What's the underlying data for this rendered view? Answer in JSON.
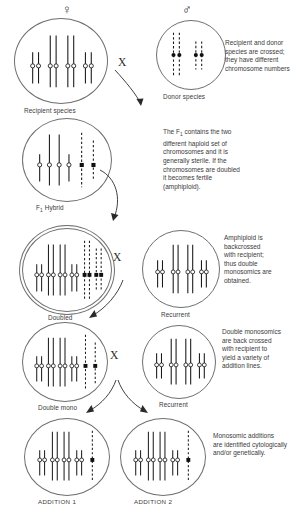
{
  "diagram": {
    "type": "genetics-breeding-scheme",
    "symbols": {
      "female": "♀",
      "male": "♂",
      "cross": "X"
    },
    "colors": {
      "outline": "#6f6f6f",
      "chromosome": "#1a1a1a",
      "text": "#3a3a3a",
      "background": "#ffffff"
    },
    "legend": {
      "solid_chromosome": "recipient species chromosome (solid line, open centromere)",
      "dashed_chromosome": "donor species chromosome (dashed line, filled centromere)"
    }
  },
  "cells": [
    {
      "id": "recipient-species",
      "label": "Recipient species",
      "symbol": "♀",
      "double_ring": false,
      "solid_chromosomes": 8,
      "dashed_chromosomes": 0,
      "centromere": "open",
      "pairs": [
        {
          "type": "solid",
          "count": 2,
          "length": "short"
        },
        {
          "type": "solid",
          "count": 2,
          "length": "long"
        },
        {
          "type": "solid",
          "count": 2,
          "length": "long"
        },
        {
          "type": "solid",
          "count": 2,
          "length": "short"
        }
      ]
    },
    {
      "id": "donor-species",
      "label": "Donor species",
      "symbol": "♂",
      "double_ring": false,
      "solid_chromosomes": 0,
      "dashed_chromosomes": 4,
      "centromere": "filled",
      "pairs": [
        {
          "type": "dashed",
          "count": 2,
          "length": "long"
        },
        {
          "type": "dashed",
          "count": 2,
          "length": "short"
        }
      ]
    },
    {
      "id": "f1-hybrid",
      "label": "F1 Hybrid",
      "label_base": "F",
      "label_sub": "1",
      "label_rest": " Hybrid",
      "double_ring": false,
      "solid_chromosomes": 4,
      "dashed_chromosomes": 2,
      "centromere": "mixed"
    },
    {
      "id": "doubled",
      "label": "Doubled",
      "double_ring": true,
      "solid_chromosomes": 8,
      "dashed_chromosomes": 4,
      "centromere": "mixed"
    },
    {
      "id": "recurrent-1",
      "label": "Recurrent",
      "double_ring": false,
      "solid_chromosomes": 8,
      "dashed_chromosomes": 0,
      "centromere": "open"
    },
    {
      "id": "double-mono",
      "label": "Double mono",
      "double_ring": false,
      "solid_chromosomes": 8,
      "dashed_chromosomes": 2,
      "centromere": "mixed"
    },
    {
      "id": "recurrent-2",
      "label": "Recurrent",
      "double_ring": false,
      "solid_chromosomes": 8,
      "dashed_chromosomes": 0,
      "centromere": "open"
    },
    {
      "id": "addition-1",
      "label": "ADDITION 1",
      "double_ring": false,
      "solid_chromosomes": 8,
      "dashed_chromosomes": 1,
      "centromere": "mixed"
    },
    {
      "id": "addition-2",
      "label": "ADDITION 2",
      "double_ring": false,
      "solid_chromosomes": 8,
      "dashed_chromosomes": 1,
      "centromere": "mixed"
    }
  ],
  "notes": [
    {
      "id": "note-1",
      "text": "Recipient and donor species are crossed; they have different chromosome numbers"
    },
    {
      "id": "note-2",
      "text": "The F1 contains the two different haploid set of chromosomes and it is generally sterile.  If the chromosomes are doubled it becomes fertile (amphiploid).",
      "line1_pre": "The F",
      "line1_sub": "1",
      "line1_post": " contains the two",
      "lines_rest": [
        "different haploid set of",
        "chromosomes and it is",
        "generally sterile.  If the",
        "chromosomes are doubled",
        "it becomes fertile",
        "(amphiploid)."
      ]
    },
    {
      "id": "note-3",
      "text": "Amphiploid is backcrossed with recipient; thus double monosomics are obtained.",
      "lines": [
        "Amphiploid is",
        "backcrossed",
        "with recipient;",
        "thus double",
        "monosomics are",
        "obtained."
      ]
    },
    {
      "id": "note-4",
      "text": "Double monosomics are back crossed with recipient to yield a variety of addition lines.",
      "lines": [
        "Double monosomics",
        "are back crossed",
        "with recipient to",
        "yield a variety of",
        "addition lines."
      ]
    },
    {
      "id": "note-5",
      "text": "Monosomic additions are identified cytologically and/or genetically.",
      "lines": [
        "Monosomic additions",
        "are identified cytologically",
        "and/or genetically."
      ]
    }
  ],
  "crosses": [
    {
      "id": "cross-1",
      "label": "X"
    },
    {
      "id": "cross-2",
      "label": "X"
    },
    {
      "id": "cross-3",
      "label": "X"
    }
  ]
}
